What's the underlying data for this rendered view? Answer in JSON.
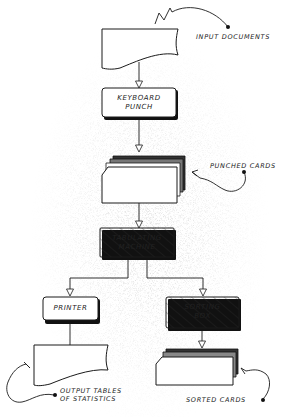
{
  "diagram": {
    "type": "flowchart",
    "nodes": [
      {
        "id": "input_documents",
        "shape": "document",
        "label": ""
      },
      {
        "id": "keyboard_punch",
        "shape": "process",
        "label_line1": "KEYBOARD",
        "label_line2": "PUNCH"
      },
      {
        "id": "punched_cards",
        "shape": "card-deck",
        "label": ""
      },
      {
        "id": "tabulating_machine",
        "shape": "process-hatched",
        "label_line1": "TABULATING",
        "label_line2": "MACHINE"
      },
      {
        "id": "printer",
        "shape": "process",
        "label_line1": "PRINTER"
      },
      {
        "id": "sorting_box",
        "shape": "process-hatched",
        "label_line1": "SORTING",
        "label_line2": "BOX"
      },
      {
        "id": "output_tables",
        "shape": "document",
        "label": ""
      },
      {
        "id": "sorted_cards",
        "shape": "card-deck",
        "label": ""
      }
    ],
    "edges": [
      {
        "from": "input_documents",
        "to": "keyboard_punch"
      },
      {
        "from": "keyboard_punch",
        "to": "punched_cards"
      },
      {
        "from": "punched_cards",
        "to": "tabulating_machine"
      },
      {
        "from": "tabulating_machine",
        "to": "printer"
      },
      {
        "from": "tabulating_machine",
        "to": "sorting_box"
      },
      {
        "from": "printer",
        "to": "output_tables"
      },
      {
        "from": "sorting_box",
        "to": "sorted_cards"
      }
    ],
    "annotations": {
      "input_documents": "INPUT DOCUMENTS",
      "punched_cards": "PUNCHED CARDS",
      "output_line1": "OUTPUT TABLES",
      "output_line2": "OF STATISTICS",
      "sorted_cards": "SORTED CARDS"
    },
    "colors": {
      "ink": "#1a1a1a",
      "paper": "#ffffff",
      "stipple": "#9a9a9a"
    }
  }
}
